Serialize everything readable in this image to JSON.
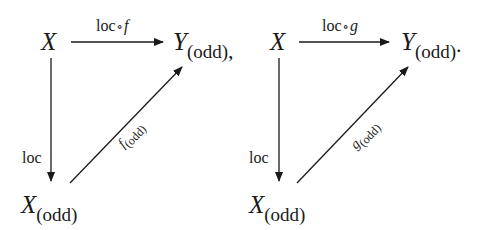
{
  "diagrams": [
    {
      "nodes": {
        "source": {
          "symbol": "X",
          "subscript": ""
        },
        "target": {
          "symbol": "Y",
          "subscript": "(odd)",
          "punctuation": ","
        },
        "corner": {
          "symbol": "X",
          "subscript": "(odd)"
        }
      },
      "arrows": {
        "top": {
          "label_prefix": "loc",
          "compose": "∘",
          "label_map": "f"
        },
        "vertical": {
          "label": "loc"
        },
        "diagonal": {
          "label_map": "f",
          "label_subscript": "(odd)"
        }
      }
    },
    {
      "nodes": {
        "source": {
          "symbol": "X",
          "subscript": ""
        },
        "target": {
          "symbol": "Y",
          "subscript": "(odd)",
          "punctuation": "."
        },
        "corner": {
          "symbol": "X",
          "subscript": "(odd)"
        }
      },
      "arrows": {
        "top": {
          "label_prefix": "loc",
          "compose": "∘",
          "label_map": "g"
        },
        "vertical": {
          "label": "loc"
        },
        "diagonal": {
          "label_map": "g",
          "label_subscript": "(odd)"
        }
      }
    }
  ],
  "colors": {
    "ink": "#1a1a1a",
    "background": "#ffffff"
  }
}
